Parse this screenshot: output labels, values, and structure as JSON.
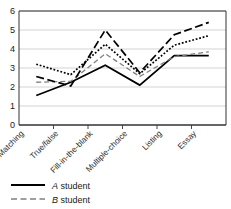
{
  "chart_data": {
    "type": "line",
    "title": "",
    "xlabel": "",
    "ylabel": "",
    "ylim": [
      0,
      6
    ],
    "yticks": [
      "0",
      "1",
      "2",
      "3",
      "4",
      "5",
      "6"
    ],
    "grid": true,
    "legend_position": "bottom-left",
    "categories": [
      "Matching",
      "True/false",
      "Fill-in-the-blank",
      "Multiple-choice",
      "Listing",
      "Essay"
    ],
    "series": [
      {
        "name": "A student",
        "style": "solid",
        "color": "#000000",
        "values": [
          1.55,
          2.25,
          3.15,
          2.1,
          3.65,
          3.65
        ]
      },
      {
        "name": "B student",
        "style": "dashed",
        "color": "#808080",
        "values": [
          2.25,
          2.3,
          3.75,
          2.55,
          3.6,
          3.85
        ]
      },
      {
        "name": "series-3",
        "style": "long-dashed",
        "color": "#000000",
        "values": [
          2.55,
          2.05,
          5.0,
          2.75,
          4.75,
          5.4
        ]
      },
      {
        "name": "series-4",
        "style": "dotted",
        "color": "#000000",
        "values": [
          3.2,
          2.65,
          4.25,
          2.7,
          4.2,
          4.7
        ]
      }
    ]
  },
  "legend": {
    "items": [
      {
        "emphasis": "A",
        "label": " student",
        "style": "solid"
      },
      {
        "emphasis": "B",
        "label": " student",
        "style": "dashed"
      }
    ]
  },
  "colors": {
    "axis": "#333333",
    "grid": "#c8c8c8",
    "plot_background": "#ffffff",
    "solid_series": "#000000",
    "gray_series": "#808080"
  }
}
